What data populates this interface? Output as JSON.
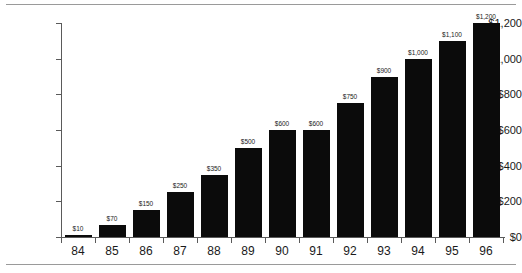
{
  "chart_data": {
    "type": "bar",
    "title": "",
    "xlabel": "",
    "ylabel": "",
    "categories": [
      "84",
      "85",
      "86",
      "87",
      "88",
      "89",
      "90",
      "91",
      "92",
      "93",
      "94",
      "95",
      "96"
    ],
    "values": [
      10,
      70,
      150,
      250,
      350,
      500,
      600,
      600,
      750,
      900,
      1000,
      1100,
      1200
    ],
    "value_labels": [
      "$10",
      "$70",
      "$150",
      "$250",
      "$350",
      "$500",
      "$600",
      "$600",
      "$750",
      "$900",
      "$1,000",
      "$1,100",
      "$1,200"
    ],
    "ylim": [
      0,
      1200
    ],
    "y_ticks": [
      0,
      200,
      400,
      600,
      800,
      1000,
      1200
    ],
    "y_tick_labels": [
      "$0",
      "$200",
      "$400",
      "$600",
      "$800",
      "$1,000",
      "$1,200"
    ],
    "grid": false,
    "legend": null,
    "series": [
      {
        "name": "",
        "values": [
          10,
          70,
          150,
          250,
          350,
          500,
          600,
          600,
          750,
          900,
          1000,
          1100,
          1200
        ]
      }
    ],
    "bar_color": "#0b0b0b",
    "axis_color": "#5a5a5a",
    "text_color": "#1a1a1a",
    "background_color": "#ffffff",
    "rule_color": "#9a9a9a"
  }
}
